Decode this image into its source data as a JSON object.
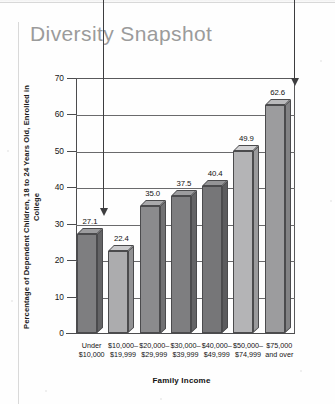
{
  "title": "Diversity Snapshot",
  "chart_data": {
    "type": "bar",
    "title": "Diversity Snapshot",
    "xlabel": "Family Income",
    "ylabel": "Percentage of Dependent Children, 18 to 24 Years Old, Enrolled in College",
    "ylim": [
      0,
      70
    ],
    "yticks": [
      0,
      10,
      20,
      30,
      40,
      50,
      60,
      70
    ],
    "grid": true,
    "legend": "none",
    "categories": [
      "Under $10,000",
      "$10,000–$19,999",
      "$20,000–$29,999",
      "$30,000–$39,999",
      "$40,000–$49,999",
      "$50,000–$74,999",
      "$75,000 and over"
    ],
    "category_lines": [
      [
        "Under",
        "$10,000"
      ],
      [
        "$10,000–",
        "$19,999"
      ],
      [
        "$20,000–",
        "$29,999"
      ],
      [
        "$30,000–",
        "$39,999"
      ],
      [
        "$40,000–",
        "$49,999"
      ],
      [
        "$50,000–",
        "$74,999"
      ],
      [
        "$75,000",
        "and over"
      ]
    ],
    "values": [
      27.1,
      22.4,
      35.0,
      37.5,
      40.4,
      49.9,
      62.6
    ],
    "value_labels": [
      "27.1",
      "22.4",
      "35.0",
      "37.5",
      "40.4",
      "49.9",
      "62.6"
    ],
    "bar_colors": [
      "#7e7e80",
      "#acacae",
      "#8b8b8d",
      "#7e7e80",
      "#767678",
      "#b4b4b6",
      "#9c9c9e"
    ],
    "annotations": [
      {
        "name": "arrow-to-lowest-bar",
        "target_label": "27.1"
      },
      {
        "name": "arrow-to-highest-bar",
        "target_label": "62.6"
      }
    ]
  },
  "colors": {
    "title": "#9b9b9b",
    "axis": "#4c4c4e",
    "grid": "#6a6a6c",
    "text": "#141414",
    "arrow": "#3d3d3f"
  },
  "yticks_display": [
    "70",
    "60",
    "50",
    "40",
    "30",
    "20",
    "10",
    "0"
  ]
}
